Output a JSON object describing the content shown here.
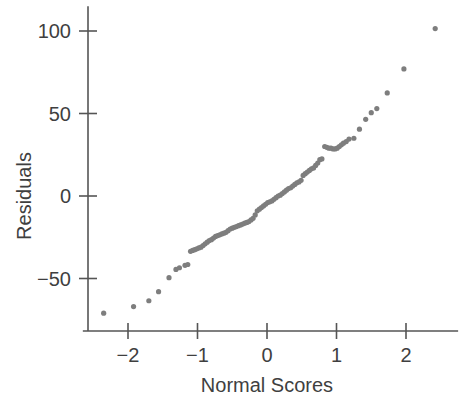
{
  "chart_data": {
    "type": "scatter",
    "title": "",
    "xlabel": "Normal Scores",
    "ylabel": "Residuals",
    "xlim": [
      -2.65,
      2.75
    ],
    "ylim": [
      -85,
      115
    ],
    "xticks": [
      -2,
      -1,
      0,
      1,
      2
    ],
    "xticklabels": [
      "−2",
      "−1",
      "0",
      "1",
      "2"
    ],
    "yticks": [
      -50,
      0,
      50,
      100
    ],
    "yticklabels": [
      "−50",
      "0",
      "50",
      "100"
    ],
    "grid": false,
    "legend": null,
    "marker": {
      "shape": "circle",
      "color": "#7e7e7e",
      "size": 5.2
    },
    "series": [
      {
        "name": "Residuals vs Normal Scores",
        "points": [
          [
            -2.35,
            -71.0
          ],
          [
            -1.92,
            -67.0
          ],
          [
            -1.7,
            -63.5
          ],
          [
            -1.56,
            -58.0
          ],
          [
            -1.41,
            -49.5
          ],
          [
            -1.31,
            -44.5
          ],
          [
            -1.26,
            -43.5
          ],
          [
            -1.18,
            -42.0
          ],
          [
            -1.14,
            -41.5
          ],
          [
            -1.1,
            -33.5
          ],
          [
            -1.07,
            -33.0
          ],
          [
            -1.04,
            -32.5
          ],
          [
            -1.01,
            -32.0
          ],
          [
            -0.98,
            -31.5
          ],
          [
            -0.95,
            -31.0
          ],
          [
            -0.92,
            -30.0
          ],
          [
            -0.89,
            -29.0
          ],
          [
            -0.86,
            -28.0
          ],
          [
            -0.83,
            -27.0
          ],
          [
            -0.8,
            -26.5
          ],
          [
            -0.77,
            -25.5
          ],
          [
            -0.74,
            -24.5
          ],
          [
            -0.71,
            -24.0
          ],
          [
            -0.68,
            -23.5
          ],
          [
            -0.65,
            -23.0
          ],
          [
            -0.62,
            -22.5
          ],
          [
            -0.59,
            -22.0
          ],
          [
            -0.56,
            -21.0
          ],
          [
            -0.53,
            -20.0
          ],
          [
            -0.5,
            -19.5
          ],
          [
            -0.47,
            -19.0
          ],
          [
            -0.44,
            -18.5
          ],
          [
            -0.41,
            -18.0
          ],
          [
            -0.38,
            -17.5
          ],
          [
            -0.35,
            -17.0
          ],
          [
            -0.32,
            -16.5
          ],
          [
            -0.29,
            -16.0
          ],
          [
            -0.26,
            -15.5
          ],
          [
            -0.23,
            -14.5
          ],
          [
            -0.2,
            -13.5
          ],
          [
            -0.17,
            -11.5
          ],
          [
            -0.14,
            -9.0
          ],
          [
            -0.11,
            -8.0
          ],
          [
            -0.08,
            -7.0
          ],
          [
            -0.05,
            -6.0
          ],
          [
            -0.02,
            -5.0
          ],
          [
            0.01,
            -4.0
          ],
          [
            0.04,
            -3.5
          ],
          [
            0.07,
            -3.0
          ],
          [
            0.1,
            -2.0
          ],
          [
            0.13,
            -1.0
          ],
          [
            0.16,
            0.0
          ],
          [
            0.19,
            0.5
          ],
          [
            0.22,
            1.5
          ],
          [
            0.25,
            2.5
          ],
          [
            0.28,
            3.5
          ],
          [
            0.31,
            4.5
          ],
          [
            0.34,
            5.0
          ],
          [
            0.37,
            6.0
          ],
          [
            0.4,
            7.0
          ],
          [
            0.43,
            8.0
          ],
          [
            0.46,
            8.5
          ],
          [
            0.49,
            9.5
          ],
          [
            0.52,
            12.5
          ],
          [
            0.55,
            13.5
          ],
          [
            0.58,
            14.5
          ],
          [
            0.61,
            15.5
          ],
          [
            0.64,
            16.5
          ],
          [
            0.67,
            17.0
          ],
          [
            0.7,
            18.5
          ],
          [
            0.73,
            20.0
          ],
          [
            0.76,
            22.0
          ],
          [
            0.79,
            22.5
          ],
          [
            0.83,
            30.0
          ],
          [
            0.86,
            29.5
          ],
          [
            0.89,
            29.0
          ],
          [
            0.92,
            29.0
          ],
          [
            0.95,
            28.5
          ],
          [
            0.98,
            28.5
          ],
          [
            1.01,
            29.0
          ],
          [
            1.04,
            30.0
          ],
          [
            1.07,
            31.0
          ],
          [
            1.1,
            32.0
          ],
          [
            1.14,
            33.0
          ],
          [
            1.18,
            34.5
          ],
          [
            1.25,
            35.0
          ],
          [
            1.33,
            40.5
          ],
          [
            1.42,
            46.5
          ],
          [
            1.5,
            50.5
          ],
          [
            1.58,
            53.0
          ],
          [
            1.73,
            62.5
          ],
          [
            1.97,
            77.0
          ],
          [
            2.42,
            101.5
          ]
        ]
      }
    ]
  },
  "axes": {
    "y_axis_name": "y-axis",
    "x_axis_name": "x-axis"
  }
}
